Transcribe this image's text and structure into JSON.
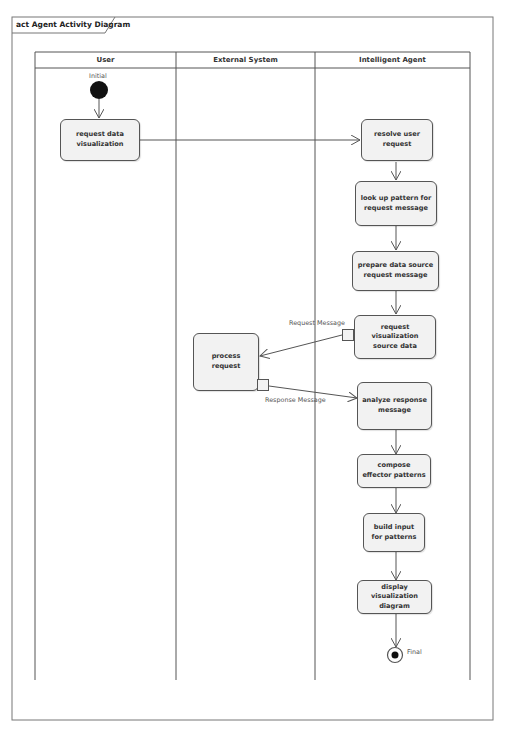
{
  "diagram": {
    "frame_title": "act Agent Activity Diagram",
    "swimlanes": [
      {
        "name": "User"
      },
      {
        "name": "External System"
      },
      {
        "name": "Intelligent Agent"
      }
    ],
    "initial_node": {
      "label": "Initial"
    },
    "final_node": {
      "label": "Final"
    },
    "actions": [
      {
        "id": "a1",
        "lane": "User",
        "label": "request data visualization"
      },
      {
        "id": "a2",
        "lane": "Intelligent Agent",
        "label": "resolve user request"
      },
      {
        "id": "a3",
        "lane": "Intelligent Agent",
        "label": "look up pattern for request message"
      },
      {
        "id": "a4",
        "lane": "Intelligent Agent",
        "label": "prepare data source request message"
      },
      {
        "id": "a5",
        "lane": "Intelligent Agent",
        "label": "request visualization source data"
      },
      {
        "id": "a6",
        "lane": "External System",
        "label": "process request"
      },
      {
        "id": "a7",
        "lane": "Intelligent Agent",
        "label": "analyze response message"
      },
      {
        "id": "a8",
        "lane": "Intelligent Agent",
        "label": "compose effector patterns"
      },
      {
        "id": "a9",
        "lane": "Intelligent Agent",
        "label": "build input for patterns"
      },
      {
        "id": "a10",
        "lane": "Intelligent Agent",
        "label": "display visualization diagram"
      }
    ],
    "object_flows": [
      {
        "from": "a5",
        "to": "a6",
        "label": "Request Message"
      },
      {
        "from": "a6",
        "to": "a7",
        "label": "Response Message"
      }
    ],
    "edges": [
      {
        "from": "initial",
        "to": "a1"
      },
      {
        "from": "a1",
        "to": "a2"
      },
      {
        "from": "a2",
        "to": "a3"
      },
      {
        "from": "a3",
        "to": "a4"
      },
      {
        "from": "a4",
        "to": "a5"
      },
      {
        "from": "a7",
        "to": "a8"
      },
      {
        "from": "a8",
        "to": "a9"
      },
      {
        "from": "a9",
        "to": "a10"
      },
      {
        "from": "a10",
        "to": "final"
      }
    ],
    "colors": {
      "line": "#555555",
      "action_fill": "#f2f2f2",
      "initial_fill": "#111111"
    }
  }
}
